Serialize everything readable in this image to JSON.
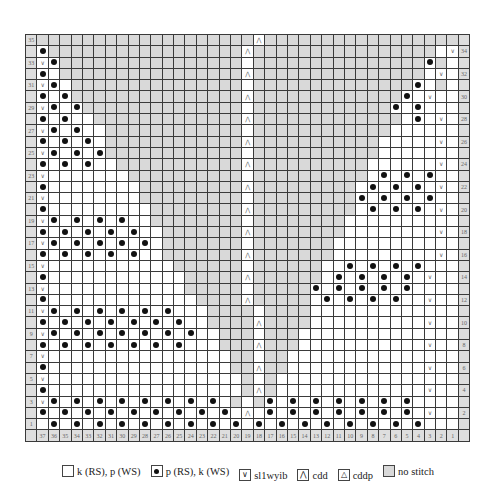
{
  "chart": {
    "col_labels": [
      "37",
      "36",
      "35",
      "34",
      "33",
      "32",
      "31",
      "30",
      "29",
      "28",
      "27",
      "26",
      "25",
      "24",
      "23",
      "22",
      "21",
      "20",
      "19",
      "18",
      "17",
      "16",
      "15",
      "14",
      "13",
      "12",
      "11",
      "10",
      "9",
      "8",
      "7",
      "6",
      "5",
      "4",
      "3",
      "2",
      "1"
    ],
    "rows": [
      {
        "n": 35,
        "cells": "###################P##################"
      },
      {
        "n": 34,
        "cells": "o#################A################.v"
      },
      {
        "n": 33,
        "cells": "vo################.###############o#"
      },
      {
        "n": 32,
        "cells": "o.################A###############.v"
      },
      {
        "n": 31,
        "cells": "vo.###############.##############o.#"
      },
      {
        "n": 30,
        "cells": "o.o###############A#############o.v"
      },
      {
        "n": 29,
        "cells": "vo.o##############.############o.o."
      },
      {
        "n": 28,
        "cells": "o.o..#############A#############.o.v"
      },
      {
        "n": 27,
        "cells": "vo.o..############.############....."
      },
      {
        "n": 26,
        "cells": "o.o.o.############A###########.....v"
      },
      {
        "n": 25,
        "cells": "vo.o.o############.###########......"
      },
      {
        "n": 24,
        "cells": "o.o.o..###########A##########......v"
      },
      {
        "n": 23,
        "cells": "v.......##########.##########.o.o.o."
      },
      {
        "n": 22,
        "cells": "o........#########A#########.o.o.o.v"
      },
      {
        "n": 21,
        "cells": "v........#########.#########o.o.o.o."
      },
      {
        "n": 20,
        "cells": "o.........########A#########.o.o.o.v"
      },
      {
        "n": 19,
        "cells": "vo.o.o.o..########.########........."
      },
      {
        "n": 18,
        "cells": "o.o.o.o.o..#######A########........v"
      },
      {
        "n": 17,
        "cells": "vo.o.o.o.o.#######.#######.........."
      },
      {
        "n": 16,
        "cells": "o.o.o.o.o..#######A#######.........v"
      },
      {
        "n": 15,
        "cells": "v...........######.######..o.o.o.o.."
      },
      {
        "n": 14,
        "cells": "o............#####A######.o.o.o.o.v"
      },
      {
        "n": 13,
        "cells": "v............#####.#####o.o.o.o.o.."
      },
      {
        "n": 12,
        "cells": "o.............####A#####.o.o.o.o..v"
      },
      {
        "n": 11,
        "cells": "vo.o.o.o.o.o...####.####..........."
      },
      {
        "n": 10,
        "cells": "o.o.o.o.o.o.o..####A####..........v"
      },
      {
        "n": 9,
        "cells": "vo.o.o.o.o.o.o..###.###............"
      },
      {
        "n": 8,
        "cells": "o.o.o.o.o.o.o...###A###...........v"
      },
      {
        "n": 7,
        "cells": "v................##.##............."
      },
      {
        "n": 6,
        "cells": "o................##A##............v"
      },
      {
        "n": 5,
        "cells": "v.................#.#.............."
      },
      {
        "n": 4,
        "cells": "o.................#A#.............v"
      },
      {
        "n": 3,
        "cells": "vo.o.o.o.o.o.o.o.#.#o.o.o.o.o.o.o.."
      },
      {
        "n": 2,
        "cells": "o.o.o.o.o.o.o.o.o.A.o.o.o.o.o.o.o.v"
      },
      {
        "n": 1,
        "cells": ".o.o.o.o.o.o.o.o.o.o.o.o.o.o.o.o.o."
      }
    ]
  },
  "symbols": {
    "v": "∨",
    "A": "⋀",
    "P": "⋀"
  },
  "legend": [
    {
      "swatch": "white",
      "label": "k (RS), p (WS)"
    },
    {
      "swatch": "dot",
      "label": "p (RS), k (WS)"
    },
    {
      "swatch": "sl",
      "glyph": "∨",
      "label": "sl1wyib"
    },
    {
      "swatch": "cdd",
      "glyph": "⋀",
      "label": "cdd"
    },
    {
      "swatch": "cddp",
      "glyph": "△",
      "label": "cddp"
    },
    {
      "swatch": "gray",
      "label": "no stitch"
    }
  ]
}
